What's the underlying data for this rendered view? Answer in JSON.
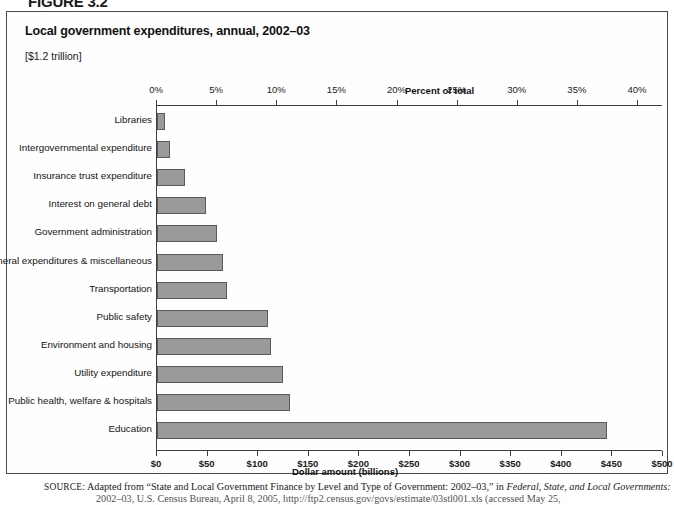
{
  "figure_label": "FIGURE 3.2",
  "chart": {
    "title": "Local government expenditures, annual, 2002–03",
    "subtitle": "[$1.2 trillion]"
  },
  "source": {
    "prefix": "SOURCE",
    "line1_a": ": Adapted from “State and Local Government Finance by Level and Type of Government: 2002–03,” in ",
    "line1_italic": "Federal, State, and Local Governments:",
    "line2": "2002–03, U.S. Census Bureau, April 8, 2005, http://ftp2.census.gov/govs/estimate/03stl001.xls (accessed May 25,"
  },
  "chart_data": {
    "type": "bar",
    "orientation": "horizontal",
    "title": "Local government expenditures, annual, 2002–03",
    "subtitle": "[$1.2 trillion]",
    "xlabel_top": "Percent of total",
    "xlabel_bottom": "Dollar amount (billions)",
    "ylabel": "",
    "grid": false,
    "legend": null,
    "bar_color": "#9a9a9a",
    "bar_border_color": "#5b5b5b",
    "xlim_percent": [
      0,
      40
    ],
    "xlim_dollars": [
      0,
      500
    ],
    "xticks_top": [
      "0%",
      "5%",
      "10%",
      "15%",
      "20%",
      "25%",
      "30%",
      "35%",
      "40%"
    ],
    "xticks_top_values": [
      0,
      5,
      10,
      15,
      20,
      25,
      30,
      35,
      40
    ],
    "xticks_bottom": [
      "$0",
      "$50",
      "$100",
      "$150",
      "$200",
      "$250",
      "$300",
      "$350",
      "$400",
      "$450",
      "$500"
    ],
    "xticks_bottom_values": [
      0,
      50,
      100,
      150,
      200,
      250,
      300,
      350,
      400,
      450,
      500
    ],
    "categories": [
      "Libraries",
      "Intergovernmental expenditure",
      "Insurance trust expenditure",
      "Interest on general debt",
      "Government administration",
      "General expenditures & miscellaneous",
      "Transportation",
      "Public safety",
      "Environment and housing",
      "Utility expenditure",
      "Public health, welfare & hospitals",
      "Education"
    ],
    "values_percent": [
      0.7,
      1.1,
      2.3,
      4.1,
      5.0,
      5.5,
      5.8,
      9.2,
      9.5,
      10.5,
      11.1,
      37.4
    ],
    "values_dollars_billions": [
      8,
      13,
      28,
      49,
      60,
      66,
      70,
      111,
      114,
      126,
      133,
      449
    ]
  }
}
